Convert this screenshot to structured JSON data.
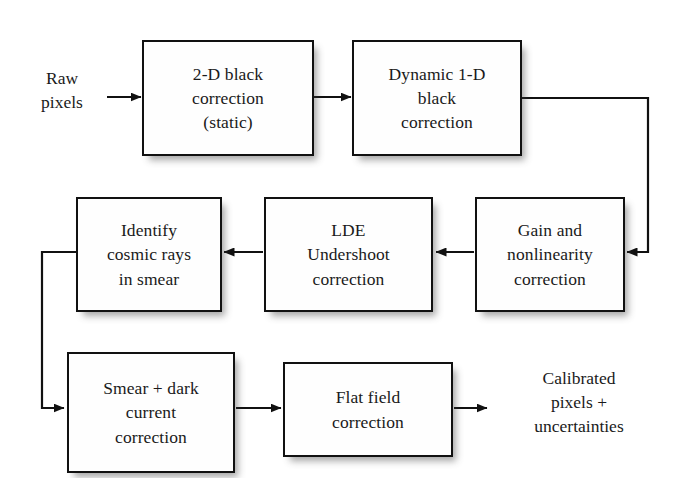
{
  "diagram": {
    "background_color": "#ffffff",
    "stroke_color": "#111111",
    "text_color": "#1a1a1a",
    "input_label": "Raw\npixels",
    "output_label": "Calibrated\npixels +\nuncertainties",
    "nodes": [
      {
        "id": "2d-black",
        "label": "2-D black\ncorrection\n(static)"
      },
      {
        "id": "dynamic-1d",
        "label": "Dynamic 1-D\nblack\ncorrection"
      },
      {
        "id": "gain",
        "label": "Gain and\nnonlinearity\ncorrection"
      },
      {
        "id": "lde",
        "label": "LDE\nUndershoot\ncorrection"
      },
      {
        "id": "cosmic",
        "label": "Identify\ncosmic rays\nin smear"
      },
      {
        "id": "smear",
        "label": "Smear + dark\ncurrent\ncorrection"
      },
      {
        "id": "flat",
        "label": "Flat field\ncorrection"
      }
    ],
    "edges": [
      {
        "id": "raw-to-2d",
        "from": "raw pixels",
        "to": "2-D black correction",
        "direction": "right"
      },
      {
        "id": "2d-to-dynamic",
        "from": "2-D black correction",
        "to": "Dynamic 1-D black correction",
        "direction": "right"
      },
      {
        "id": "dynamic-to-gain",
        "from": "Dynamic 1-D black correction",
        "to": "Gain and nonlinearity correction",
        "direction": "right-down-left"
      },
      {
        "id": "gain-to-lde",
        "from": "Gain and nonlinearity correction",
        "to": "LDE Undershoot correction",
        "direction": "left"
      },
      {
        "id": "lde-to-cosmic",
        "from": "LDE Undershoot correction",
        "to": "Identify cosmic rays in smear",
        "direction": "left"
      },
      {
        "id": "cosmic-to-smear",
        "from": "Identify cosmic rays in smear",
        "to": "Smear + dark current correction",
        "direction": "left-down-right"
      },
      {
        "id": "smear-to-flat",
        "from": "Smear + dark current correction",
        "to": "Flat field correction",
        "direction": "right"
      },
      {
        "id": "flat-to-calibrated",
        "from": "Flat field correction",
        "to": "Calibrated pixels + uncertainties",
        "direction": "right"
      }
    ]
  }
}
